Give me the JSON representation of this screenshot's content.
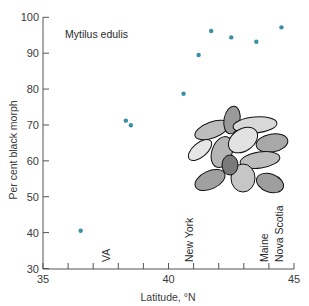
{
  "chart_data": {
    "type": "scatter",
    "title": "Mytilus edulis",
    "xlabel": "Latitude, °N",
    "ylabel": "Per cent black morph",
    "xlim": [
      35,
      45
    ],
    "ylim": [
      30,
      100
    ],
    "x_ticks": [
      35,
      36,
      37,
      38,
      39,
      40,
      41,
      42,
      43,
      44,
      45
    ],
    "x_tick_labels": [
      "35",
      "40",
      "45"
    ],
    "y_ticks": [
      30,
      40,
      50,
      60,
      70,
      80,
      90,
      100
    ],
    "y_tick_labels": [
      "30",
      "40",
      "50",
      "60",
      "70",
      "80",
      "90",
      "100"
    ],
    "grid": false,
    "point_color": "#3a8ea6",
    "series": [
      {
        "name": "Mytilus edulis",
        "points": [
          {
            "x": 36.5,
            "y": 40.5
          },
          {
            "x": 38.3,
            "y": 71.2
          },
          {
            "x": 38.5,
            "y": 69.9
          },
          {
            "x": 40.6,
            "y": 78.7
          },
          {
            "x": 41.2,
            "y": 89.5
          },
          {
            "x": 41.7,
            "y": 96.2
          },
          {
            "x": 42.5,
            "y": 94.4
          },
          {
            "x": 43.5,
            "y": 93.2
          },
          {
            "x": 44.5,
            "y": 97.2
          }
        ]
      }
    ],
    "annotations": [
      {
        "text": "VA",
        "x": 37.5
      },
      {
        "text": "New York",
        "x": 40.8
      },
      {
        "text": "Maine",
        "x": 43.8
      },
      {
        "text": "Nova Scotia",
        "x": 44.4
      }
    ],
    "inset_image": "mussel-cluster-drawing"
  }
}
